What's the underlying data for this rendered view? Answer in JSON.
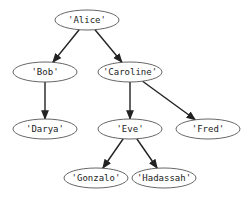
{
  "diagram": {
    "type": "tree",
    "nodes": [
      {
        "id": "alice",
        "label": "'Alice'",
        "cx": 87,
        "cy": 20
      },
      {
        "id": "bob",
        "label": "'Bob'",
        "cx": 45,
        "cy": 72
      },
      {
        "id": "caroline",
        "label": "'Caroline'",
        "cx": 130,
        "cy": 72
      },
      {
        "id": "darya",
        "label": "'Darya'",
        "cx": 45,
        "cy": 129
      },
      {
        "id": "eve",
        "label": "'Eve'",
        "cx": 130,
        "cy": 129
      },
      {
        "id": "fred",
        "label": "'Fred'",
        "cx": 208,
        "cy": 129
      },
      {
        "id": "gonzalo",
        "label": "'Gonzalo'",
        "cx": 96,
        "cy": 178
      },
      {
        "id": "hadassah",
        "label": "'Hadassah'",
        "cx": 164,
        "cy": 178
      }
    ],
    "edges": [
      {
        "from": "alice",
        "to": "bob"
      },
      {
        "from": "alice",
        "to": "caroline"
      },
      {
        "from": "bob",
        "to": "darya"
      },
      {
        "from": "caroline",
        "to": "eve"
      },
      {
        "from": "caroline",
        "to": "fred"
      },
      {
        "from": "eve",
        "to": "gonzalo"
      },
      {
        "from": "eve",
        "to": "hadassah"
      }
    ]
  }
}
